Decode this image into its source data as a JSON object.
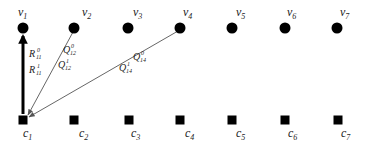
{
  "diagram": {
    "colors": {
      "node": "#000000",
      "edge_thick": "#000000",
      "edge_thin": "#555555",
      "label": "#222222"
    },
    "top_nodes": [
      {
        "id": "v1",
        "base": "v",
        "sub": "1",
        "x": 23,
        "y": 28,
        "lx": 18,
        "ly": 16
      },
      {
        "id": "v2",
        "base": "v",
        "sub": "2",
        "x": 74,
        "y": 28,
        "lx": 82,
        "ly": 16
      },
      {
        "id": "v3",
        "base": "v",
        "sub": "3",
        "x": 128,
        "y": 28,
        "lx": 133,
        "ly": 16
      },
      {
        "id": "v4",
        "base": "v",
        "sub": "4",
        "x": 180,
        "y": 28,
        "lx": 183,
        "ly": 16
      },
      {
        "id": "v5",
        "base": "v",
        "sub": "5",
        "x": 232,
        "y": 28,
        "lx": 236,
        "ly": 16
      },
      {
        "id": "v6",
        "base": "v",
        "sub": "6",
        "x": 285,
        "y": 28,
        "lx": 287,
        "ly": 16
      },
      {
        "id": "v7",
        "base": "v",
        "sub": "7",
        "x": 337,
        "y": 28,
        "lx": 340,
        "ly": 16
      }
    ],
    "bottom_nodes": [
      {
        "id": "c1",
        "base": "c",
        "sub": "1",
        "x": 23,
        "y": 120,
        "lx": 23,
        "ly": 137
      },
      {
        "id": "c2",
        "base": "c",
        "sub": "2",
        "x": 74,
        "y": 120,
        "lx": 79,
        "ly": 137
      },
      {
        "id": "c3",
        "base": "c",
        "sub": "3",
        "x": 129,
        "y": 120,
        "lx": 131,
        "ly": 137
      },
      {
        "id": "c4",
        "base": "c",
        "sub": "4",
        "x": 180,
        "y": 120,
        "lx": 185,
        "ly": 137
      },
      {
        "id": "c5",
        "base": "c",
        "sub": "5",
        "x": 232,
        "y": 120,
        "lx": 236,
        "ly": 137
      },
      {
        "id": "c6",
        "base": "c",
        "sub": "6",
        "x": 285,
        "y": 120,
        "lx": 288,
        "ly": 137
      },
      {
        "id": "c7",
        "base": "c",
        "sub": "7",
        "x": 338,
        "y": 120,
        "lx": 341,
        "ly": 137
      }
    ],
    "edges": [
      {
        "id": "c1-v1",
        "from": "c1",
        "to": "v1",
        "style": "thick",
        "x1": 23,
        "y1": 114,
        "x2": 23,
        "y2": 36
      },
      {
        "id": "v2-c1",
        "from": "v2",
        "to": "c1",
        "style": "thin",
        "x1": 73,
        "y1": 32,
        "x2": 28,
        "y2": 115
      },
      {
        "id": "v4-c1",
        "from": "v4",
        "to": "c1",
        "style": "thin",
        "x1": 178,
        "y1": 31,
        "x2": 29,
        "y2": 117
      }
    ],
    "edge_labels": [
      {
        "id": "R11-0",
        "base": "R",
        "sup": "0",
        "sub": "11",
        "x": 29,
        "y": 57
      },
      {
        "id": "R11-1",
        "base": "R",
        "sup": "1",
        "sub": "11",
        "x": 29,
        "y": 73
      },
      {
        "id": "Q12-0",
        "base": "Q",
        "sup": "0",
        "sub": "12",
        "x": 63,
        "y": 53
      },
      {
        "id": "Q12-1",
        "base": "Q",
        "sup": "1",
        "sub": "12",
        "x": 58,
        "y": 68
      },
      {
        "id": "Q14-0",
        "base": "Q",
        "sup": "0",
        "sub": "14",
        "x": 133,
        "y": 60
      },
      {
        "id": "Q14-1",
        "base": "Q",
        "sup": "1",
        "sub": "14",
        "x": 119,
        "y": 71
      }
    ]
  }
}
